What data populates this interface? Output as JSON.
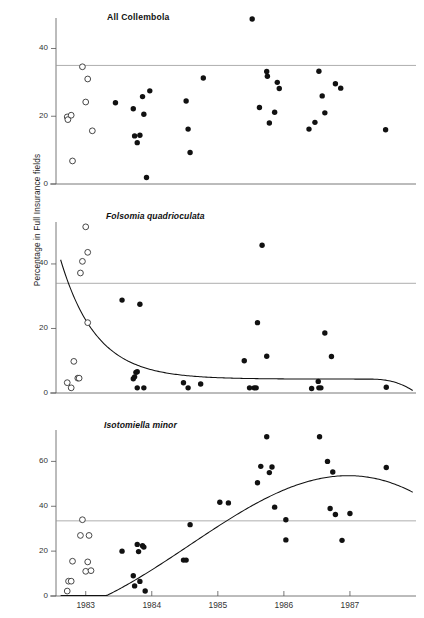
{
  "figure": {
    "ylabel": "Percentage in Full Insurance fields",
    "xticks": [
      "1983",
      "1984",
      "1985",
      "1986",
      "1987"
    ],
    "marker_legend": {
      "open_circle": "pre-treatment samples (open circles)",
      "filled_circle": "post-treatment samples (filled circles)"
    },
    "colors": {
      "axis": "#555555",
      "refline": "#999999",
      "marker": "#111111",
      "curve": "#111111",
      "text": "#1a1a1a"
    }
  },
  "chart_data": [
    {
      "type": "scatter",
      "title": "All Collembola",
      "title_style": "bold",
      "xlabel": "",
      "ylabel": "Percentage in Full Insurance fields",
      "xlim": [
        1982.55,
        1988.0
      ],
      "ylim": [
        0,
        51
      ],
      "yticks": [
        0,
        20,
        40
      ],
      "xticks": [
        1983,
        1984,
        1985,
        1986,
        1987
      ],
      "grid": false,
      "reference_line": 35,
      "legend": "none",
      "series": [
        {
          "name": "open",
          "marker": "open-circle",
          "points": [
            [
              1982.72,
              19.8
            ],
            [
              1982.73,
              19.0
            ],
            [
              1982.78,
              20.3
            ],
            [
              1982.8,
              6.8
            ],
            [
              1982.95,
              34.6
            ],
            [
              1983.0,
              24.2
            ],
            [
              1983.03,
              31.0
            ],
            [
              1983.1,
              15.7
            ]
          ]
        },
        {
          "name": "filled",
          "marker": "filled-circle",
          "points": [
            [
              1983.45,
              24.0
            ],
            [
              1983.72,
              22.2
            ],
            [
              1983.74,
              14.2
            ],
            [
              1983.78,
              12.2
            ],
            [
              1983.82,
              14.4
            ],
            [
              1983.86,
              25.8
            ],
            [
              1983.88,
              20.6
            ],
            [
              1983.92,
              1.9
            ],
            [
              1983.97,
              27.5
            ],
            [
              1984.52,
              24.5
            ],
            [
              1984.55,
              16.2
            ],
            [
              1984.58,
              9.3
            ],
            [
              1984.78,
              31.3
            ],
            [
              1985.52,
              48.7
            ],
            [
              1985.63,
              22.6
            ],
            [
              1985.74,
              33.2
            ],
            [
              1985.75,
              31.8
            ],
            [
              1985.78,
              18.0
            ],
            [
              1985.86,
              21.2
            ],
            [
              1985.9,
              30.0
            ],
            [
              1985.93,
              28.2
            ],
            [
              1986.38,
              16.2
            ],
            [
              1986.47,
              18.2
            ],
            [
              1986.53,
              33.3
            ],
            [
              1986.58,
              26.0
            ],
            [
              1986.62,
              21.0
            ],
            [
              1986.78,
              29.6
            ],
            [
              1986.86,
              28.3
            ],
            [
              1987.54,
              16.0
            ]
          ]
        }
      ]
    },
    {
      "type": "scatter",
      "title": "Folsomia quadrioculata",
      "title_style": "italic",
      "xlabel": "",
      "ylabel": "Percentage in Full Insurance fields",
      "xlim": [
        1982.55,
        1988.0
      ],
      "ylim": [
        0,
        53
      ],
      "yticks": [
        0,
        20,
        40
      ],
      "xticks": [
        1983,
        1984,
        1985,
        1986,
        1987
      ],
      "grid": false,
      "reference_line": 34,
      "legend": "none",
      "fit_curve": "exponential decay to asymptote ~4",
      "series": [
        {
          "name": "open",
          "marker": "open-circle",
          "points": [
            [
              1982.72,
              3.2
            ],
            [
              1982.78,
              1.6
            ],
            [
              1982.82,
              9.8
            ],
            [
              1982.88,
              4.6
            ],
            [
              1982.9,
              4.6
            ],
            [
              1982.92,
              37.2
            ],
            [
              1982.95,
              40.8
            ],
            [
              1983.0,
              51.5
            ],
            [
              1983.03,
              43.6
            ],
            [
              1983.03,
              21.8
            ]
          ]
        },
        {
          "name": "filled",
          "marker": "filled-circle",
          "points": [
            [
              1983.55,
              28.8
            ],
            [
              1983.72,
              4.4
            ],
            [
              1983.74,
              5.0
            ],
            [
              1983.76,
              6.4
            ],
            [
              1983.78,
              6.6
            ],
            [
              1983.78,
              1.6
            ],
            [
              1983.82,
              27.5
            ],
            [
              1983.88,
              1.6
            ],
            [
              1984.48,
              3.2
            ],
            [
              1984.55,
              1.6
            ],
            [
              1984.74,
              2.8
            ],
            [
              1985.4,
              10.0
            ],
            [
              1985.48,
              1.6
            ],
            [
              1985.55,
              1.6
            ],
            [
              1985.58,
              1.6
            ],
            [
              1985.6,
              21.8
            ],
            [
              1985.67,
              45.8
            ],
            [
              1985.74,
              11.4
            ],
            [
              1986.42,
              1.4
            ],
            [
              1986.52,
              3.6
            ],
            [
              1986.53,
              1.6
            ],
            [
              1986.56,
              1.6
            ],
            [
              1986.62,
              18.6
            ],
            [
              1986.72,
              11.3
            ],
            [
              1987.55,
              1.8
            ]
          ]
        }
      ]
    },
    {
      "type": "scatter",
      "title": "Isotomiella minor",
      "title_style": "italic",
      "xlabel": "",
      "ylabel": "Percentage in Full Insurance fields",
      "xlim": [
        1982.55,
        1988.0
      ],
      "ylim": [
        0,
        74
      ],
      "yticks": [
        0,
        20,
        40,
        60
      ],
      "xticks": [
        1983,
        1984,
        1985,
        1986,
        1987
      ],
      "grid": false,
      "reference_line": 33.5,
      "legend": "none",
      "fit_curve": "cubic rise from ~20 down to ~13 then up to ~49 peak then down",
      "series": [
        {
          "name": "open",
          "marker": "open-circle",
          "points": [
            [
              1982.72,
              2.2
            ],
            [
              1982.74,
              6.6
            ],
            [
              1982.78,
              6.6
            ],
            [
              1982.8,
              15.5
            ],
            [
              1982.92,
              27.0
            ],
            [
              1982.95,
              34.0
            ],
            [
              1983.0,
              11.0
            ],
            [
              1983.03,
              15.2
            ],
            [
              1983.05,
              27.0
            ],
            [
              1983.08,
              11.3
            ]
          ]
        },
        {
          "name": "filled",
          "marker": "filled-circle",
          "points": [
            [
              1983.55,
              20.0
            ],
            [
              1983.72,
              9.0
            ],
            [
              1983.74,
              4.5
            ],
            [
              1983.78,
              23.0
            ],
            [
              1983.8,
              19.8
            ],
            [
              1983.82,
              6.5
            ],
            [
              1983.86,
              22.4
            ],
            [
              1983.88,
              21.8
            ],
            [
              1983.9,
              2.2
            ],
            [
              1984.48,
              16.0
            ],
            [
              1984.52,
              16.0
            ],
            [
              1984.58,
              31.8
            ],
            [
              1985.03,
              41.8
            ],
            [
              1985.16,
              41.5
            ],
            [
              1985.6,
              50.5
            ],
            [
              1985.65,
              57.8
            ],
            [
              1985.74,
              71.0
            ],
            [
              1985.78,
              55.0
            ],
            [
              1985.82,
              57.5
            ],
            [
              1985.86,
              39.6
            ],
            [
              1986.03,
              34.0
            ],
            [
              1986.03,
              25.0
            ],
            [
              1986.54,
              71.0
            ],
            [
              1986.66,
              60.0
            ],
            [
              1986.7,
              39.0
            ],
            [
              1986.74,
              55.3
            ],
            [
              1986.78,
              36.3
            ],
            [
              1986.88,
              24.8
            ],
            [
              1987.0,
              36.8
            ],
            [
              1987.55,
              57.3
            ]
          ]
        }
      ]
    }
  ]
}
